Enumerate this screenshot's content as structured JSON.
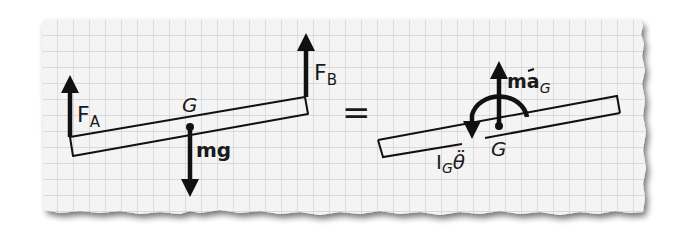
{
  "figure": {
    "type": "free-body-diagram-equivalence",
    "background": "graph paper with torn edges",
    "colors": {
      "paper": "#f3f3f3",
      "grid": "#d4d4d4",
      "ink": "#111111",
      "shadow": "#9a9a9a"
    }
  },
  "left_diagram": {
    "title": "free-body diagram",
    "labels": {
      "force_a": "F",
      "force_a_sub": "A",
      "force_b": "F",
      "force_b_sub": "B",
      "center": "G",
      "weight": "mg"
    }
  },
  "equals_sign": "=",
  "right_diagram": {
    "title": "kinetic diagram",
    "labels": {
      "inertial_force": "ma",
      "inertial_force_sub": "G",
      "inertial_moment": "I",
      "inertial_moment_sub": "G",
      "inertial_moment_symbol": "θ̈",
      "center": "G"
    }
  }
}
